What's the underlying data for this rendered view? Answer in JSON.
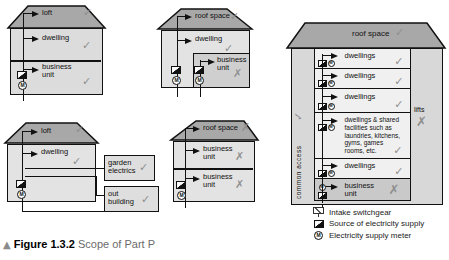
{
  "caption": {
    "marker": "▲",
    "figure": "Figure 1.3.2",
    "title": "Scope of Part P"
  },
  "icons": {
    "meter_letter": "M"
  },
  "legend": {
    "intake": "Intake switchgear",
    "source": "Source of electricity supply",
    "meter": "Electricity supply meter"
  },
  "b1": {
    "roof": {
      "label": "loft",
      "mark": "✓"
    },
    "floors": [
      {
        "label": "dwelling",
        "mark": "✓"
      },
      {
        "label": "business unit",
        "mark": "✓"
      }
    ]
  },
  "b2": {
    "roof": {
      "label": "roof space",
      "mark": "✓"
    },
    "dwelling": {
      "label": "dwelling",
      "mark": "✓"
    },
    "business": {
      "label": "business unit",
      "mark": "✗"
    }
  },
  "b3": {
    "roof": {
      "label": "loft",
      "mark": "✓"
    },
    "dwelling": {
      "label": "dwelling",
      "mark": "✓"
    },
    "garden": {
      "label": "garden electrics",
      "mark": "✓"
    },
    "outbuilding": {
      "label": "out building",
      "mark": "✓"
    }
  },
  "b4": {
    "roof": {
      "label": "roof space",
      "mark": "✗"
    },
    "floors": [
      {
        "label": "business unit",
        "mark": "✗"
      },
      {
        "label": "business unit",
        "mark": "✗"
      }
    ]
  },
  "b5": {
    "roof": {
      "label": "roof space",
      "mark": "✓"
    },
    "common_access": {
      "label": "common access",
      "mark": "✓"
    },
    "lifts": {
      "label": "lifts",
      "mark": "✗"
    },
    "floors": [
      {
        "label": "dwellings",
        "mark": "✓"
      },
      {
        "label": "dwellings",
        "mark": "✓"
      },
      {
        "label": "dwellings",
        "mark": "✓"
      },
      {
        "label": "dwellings & shared facilities such as laundries, kitchens, gyms, games rooms, etc.",
        "mark": "✓"
      },
      {
        "label": "dwellings",
        "mark": "✓"
      },
      {
        "label": "business unit",
        "mark": "✗"
      }
    ]
  },
  "colors": {
    "roof": "#a8a8a8",
    "wall": "#dcdcdc",
    "floor_light": "#f0f0f0",
    "floor_business": "#c9c9c9",
    "mark_gray": "#8f8f8f",
    "line": "#111111"
  }
}
